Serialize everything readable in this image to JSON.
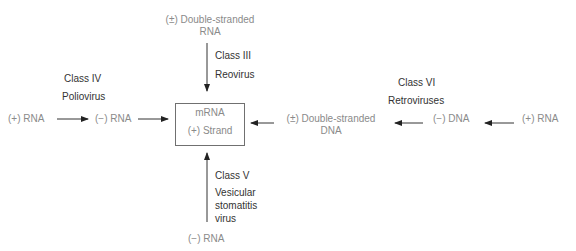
{
  "center": {
    "line1": "mRNA",
    "line2": "(+) Strand"
  },
  "top": {
    "source_line1": "(±) Double-stranded",
    "source_line2": "RNA",
    "class": "Class III",
    "example": "Reovirus"
  },
  "left": {
    "source": "(+) RNA",
    "intermediate": "(−) RNA",
    "class": "Class IV",
    "example": "Poliovirus"
  },
  "right": {
    "source": "(+) RNA",
    "intermediate1": "(−) DNA",
    "intermediate2_line1": "(±) Double-stranded",
    "intermediate2_line2": "DNA",
    "class": "Class VI",
    "example": "Retroviruses"
  },
  "bottom": {
    "source": "(−) RNA",
    "class": "Class V",
    "example_line1": "Vesicular",
    "example_line2": "stomatitis",
    "example_line3": "virus"
  }
}
